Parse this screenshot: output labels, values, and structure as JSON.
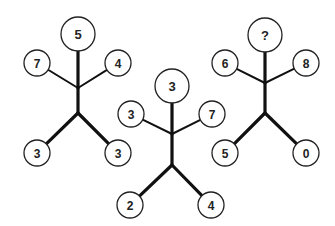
{
  "puzzle": {
    "type": "number-figure-sequence",
    "style": {
      "line_color": "#111111",
      "circle_stroke": "#222222",
      "text_color": "#222222",
      "background": "#ffffff"
    },
    "figures": [
      {
        "name": "figure-1",
        "head": {
          "label": "5",
          "cx": 78,
          "cy": 34,
          "r": 17
        },
        "left_arm": {
          "label": "7",
          "cx": 37,
          "cy": 63,
          "r": 13
        },
        "right_arm": {
          "label": "4",
          "cx": 118,
          "cy": 63,
          "r": 13
        },
        "left_leg": {
          "label": "3",
          "cx": 37,
          "cy": 153,
          "r": 13
        },
        "right_leg": {
          "label": "3",
          "cx": 118,
          "cy": 153,
          "r": 13
        },
        "neck": {
          "x": 78,
          "y": 88
        },
        "hip": {
          "x": 78,
          "y": 113
        }
      },
      {
        "name": "figure-2",
        "head": {
          "label": "3",
          "cx": 172,
          "cy": 86,
          "r": 17
        },
        "left_arm": {
          "label": "3",
          "cx": 131,
          "cy": 114,
          "r": 13
        },
        "right_arm": {
          "label": "7",
          "cx": 212,
          "cy": 114,
          "r": 13
        },
        "left_leg": {
          "label": "2",
          "cx": 130,
          "cy": 205,
          "r": 13
        },
        "right_leg": {
          "label": "4",
          "cx": 211,
          "cy": 205,
          "r": 13
        },
        "neck": {
          "x": 172,
          "y": 134
        },
        "hip": {
          "x": 172,
          "y": 165
        }
      },
      {
        "name": "figure-3",
        "head": {
          "label": "?",
          "cx": 265,
          "cy": 35,
          "r": 17
        },
        "left_arm": {
          "label": "6",
          "cx": 225,
          "cy": 63,
          "r": 13
        },
        "right_arm": {
          "label": "8",
          "cx": 306,
          "cy": 63,
          "r": 13
        },
        "left_leg": {
          "label": "5",
          "cx": 225,
          "cy": 153,
          "r": 13
        },
        "right_leg": {
          "label": "0",
          "cx": 306,
          "cy": 153,
          "r": 13
        },
        "neck": {
          "x": 265,
          "y": 83
        },
        "hip": {
          "x": 265,
          "y": 113
        }
      }
    ]
  }
}
